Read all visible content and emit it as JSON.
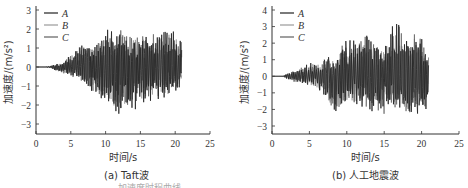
{
  "figure": {
    "bottom_caption_fragment": "……加速度时程曲线……"
  },
  "chart_data": [
    {
      "type": "line",
      "title": "(a) Taft波",
      "xlabel": "时间/s",
      "ylabel": "加速度/(m/s²)",
      "xlim": [
        0,
        25
      ],
      "ylim": [
        -3.5,
        3
      ],
      "xticks": [
        0,
        5,
        10,
        15,
        20,
        25
      ],
      "yticks": [
        -3,
        -2,
        -1,
        0,
        1,
        2,
        3
      ],
      "grid": false,
      "legend_position": "upper left",
      "legend": [
        "A",
        "B",
        "C"
      ],
      "series": [
        {
          "name": "A",
          "color": "#222222"
        },
        {
          "name": "B",
          "color": "#9a9a9a"
        },
        {
          "name": "C",
          "color": "#5e5e5e"
        }
      ],
      "signal_duration_s": 21,
      "envelope": {
        "x": [
          0,
          2,
          4,
          6,
          8,
          10,
          12,
          14,
          16,
          18,
          20,
          21
        ],
        "upper": [
          0,
          0.05,
          0.3,
          1.3,
          1.1,
          2.2,
          2.25,
          2.0,
          1.9,
          2.15,
          2.1,
          1.8
        ],
        "lower": [
          0,
          -0.05,
          -0.4,
          -0.7,
          -1.5,
          -1.9,
          -2.75,
          -2.3,
          -2.05,
          -1.8,
          -1.6,
          -0.8
        ]
      },
      "peaks": {
        "max": 2.25,
        "max_at_s": 11.5,
        "min": -2.75,
        "min_at_s": 11.5
      }
    },
    {
      "type": "line",
      "title": "(b) 人工地震波",
      "xlabel": "时间/s",
      "ylabel": "加速度/(m/s²)",
      "xlim": [
        0,
        25
      ],
      "ylim": [
        -3.3,
        4
      ],
      "xticks": [
        0,
        5,
        10,
        15,
        20,
        25
      ],
      "yticks": [
        -3,
        -2,
        -1,
        0,
        1,
        2,
        3,
        4
      ],
      "grid": false,
      "legend_position": "upper left",
      "legend": [
        "A",
        "B",
        "C"
      ],
      "series": [
        {
          "name": "A",
          "color": "#222222"
        },
        {
          "name": "B",
          "color": "#9a9a9a"
        },
        {
          "name": "C",
          "color": "#5e5e5e"
        }
      ],
      "signal_duration_s": 21,
      "envelope": {
        "x": [
          0,
          1.5,
          3,
          5,
          7,
          8.5,
          10,
          12.5,
          15,
          16.6,
          18,
          19.5,
          21
        ],
        "upper": [
          0,
          0.05,
          0.4,
          0.8,
          1.3,
          1.0,
          2.75,
          2.75,
          1.8,
          3.8,
          2.3,
          3.0,
          1.2
        ],
        "lower": [
          0,
          -0.05,
          -0.4,
          -0.6,
          -1.2,
          -2.9,
          -1.9,
          -2.0,
          -2.5,
          -2.2,
          -2.4,
          -2.95,
          -1.7
        ]
      },
      "peaks": {
        "max": 3.8,
        "max_at_s": 16.6,
        "min": -2.95,
        "min_at_s": 18.9
      }
    }
  ]
}
